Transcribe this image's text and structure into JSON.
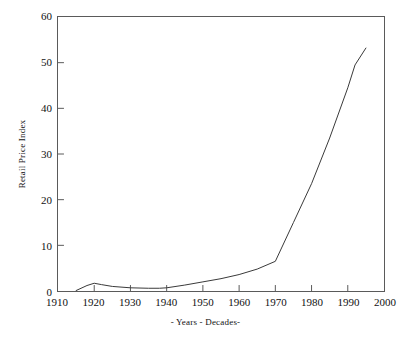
{
  "chart_data": {
    "type": "line",
    "title": "",
    "subtitle": "",
    "xlabel": "- Years - Decades-",
    "ylabel": "Retail Price Index",
    "xlim": [
      1910,
      2000
    ],
    "ylim": [
      0,
      60
    ],
    "grid": false,
    "legend": null,
    "legend_position": "none",
    "xticks": [
      1910,
      1920,
      1930,
      1940,
      1950,
      1960,
      1970,
      1980,
      1990,
      2000
    ],
    "xtick_labels": [
      "1910",
      "1920",
      "1930",
      "1940",
      "1950",
      "1960",
      "1970",
      "1980",
      "1990",
      "2000"
    ],
    "yticks": [
      0,
      10,
      20,
      30,
      40,
      50,
      60
    ],
    "ytick_labels": [
      "0",
      "10",
      "20",
      "30",
      "40",
      "50",
      "60"
    ],
    "series": [
      {
        "name": "Retail Price Index",
        "color": "#3a3a3a",
        "x": [
          1915,
          1918,
          1920,
          1922,
          1925,
          1930,
          1935,
          1938,
          1940,
          1945,
          1950,
          1955,
          1960,
          1965,
          1970,
          1975,
          1980,
          1985,
          1990,
          1992,
          1995
        ],
        "values": [
          0.1,
          1.2,
          1.7,
          1.4,
          1.0,
          0.7,
          0.6,
          0.6,
          0.7,
          1.3,
          2.0,
          2.7,
          3.6,
          4.8,
          6.5,
          15.0,
          23.5,
          33.5,
          44.5,
          49.5,
          53.2
        ]
      }
    ],
    "annotations": []
  },
  "axes": {
    "y_axis_title": "Retail Price Index",
    "x_axis_title": "- Years - Decades-"
  },
  "style": {
    "line_color": "#3a3a3a",
    "frame_color": "#5a5a5a",
    "background": "#ffffff",
    "text_color": "#111111"
  }
}
